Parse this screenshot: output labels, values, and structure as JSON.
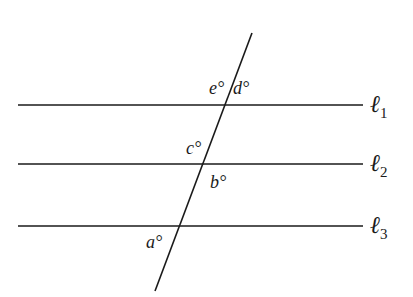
{
  "diagram": {
    "lines": [
      {
        "id": "l1",
        "name": "ℓ",
        "subscript": "1",
        "y": 105
      },
      {
        "id": "l2",
        "name": "ℓ",
        "subscript": "2",
        "y": 164
      },
      {
        "id": "l3",
        "name": "ℓ",
        "subscript": "3",
        "y": 226
      }
    ],
    "transversal": {
      "x1": 252,
      "y1": 33,
      "x2": 155,
      "y2": 291
    },
    "angles": [
      {
        "id": "e",
        "label": "e°",
        "x": 209,
        "y": 94
      },
      {
        "id": "d",
        "label": "d°",
        "x": 233,
        "y": 94
      },
      {
        "id": "c",
        "label": "c°",
        "x": 186,
        "y": 154
      },
      {
        "id": "b",
        "label": "b°",
        "x": 210,
        "y": 188
      },
      {
        "id": "a",
        "label": "a°",
        "x": 146,
        "y": 248
      }
    ],
    "colors": {
      "stroke": "#1a1a1a",
      "background": "#ffffff"
    }
  }
}
